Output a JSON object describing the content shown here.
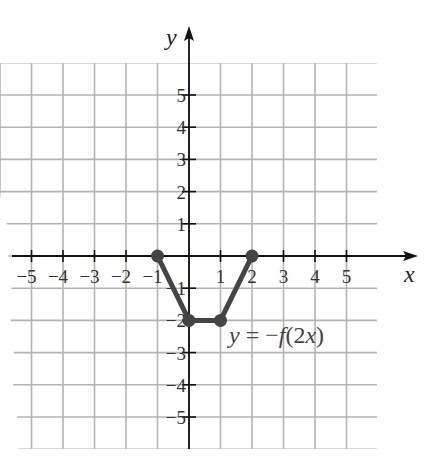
{
  "chart_data": {
    "type": "line",
    "title": "",
    "xlabel": "x",
    "ylabel": "y",
    "xlim": [
      -6,
      6
    ],
    "ylim": [
      -6,
      6
    ],
    "grid": true,
    "x_ticks": [
      -5,
      -4,
      -3,
      -2,
      -1,
      1,
      2,
      3,
      4,
      5
    ],
    "y_ticks": [
      -5,
      -4,
      -3,
      -2,
      -1,
      1,
      2,
      3,
      4,
      5
    ],
    "x_tick_labels": [
      "−5",
      "−4",
      "−3",
      "−2",
      "−1",
      "1",
      "2",
      "3",
      "4",
      "5"
    ],
    "y_tick_labels": [
      "−5",
      "−4",
      "−3",
      "−2",
      "−1",
      "1",
      "2",
      "3",
      "4",
      "5"
    ],
    "series": [
      {
        "name": "y = −f(2x)",
        "points": [
          [
            -1,
            0
          ],
          [
            0,
            -2
          ],
          [
            1,
            -2
          ],
          [
            2,
            0
          ]
        ],
        "markers": true,
        "color": "#444444"
      }
    ],
    "annotations": [
      {
        "text": "y = −f(2x)",
        "x": 1.3,
        "y": -2.6
      }
    ]
  },
  "labels": {
    "x_axis": "x",
    "y_axis": "y",
    "function_y": "y",
    "function_eq": " = −",
    "function_f": "f",
    "function_arg": "(2",
    "function_x": "x",
    "function_close": ")"
  },
  "colors": {
    "grid": "#b3b3b3",
    "axis": "#111111",
    "curve": "#444444",
    "background": "#ffffff"
  }
}
